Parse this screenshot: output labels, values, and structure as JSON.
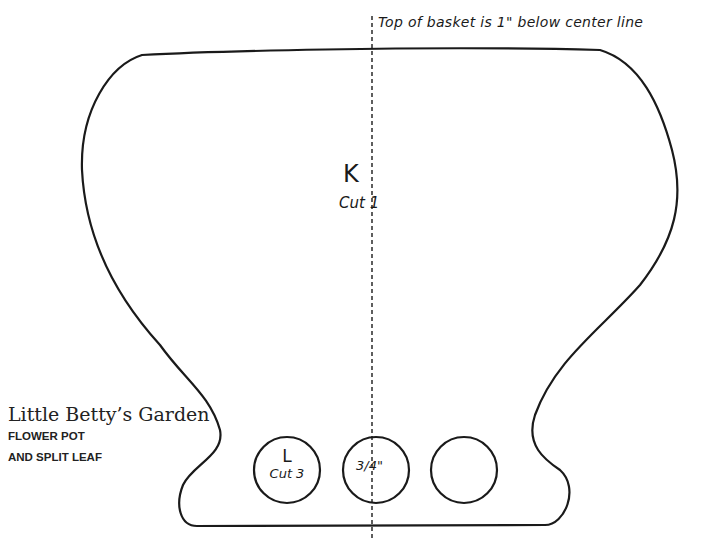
{
  "note": {
    "text": "Top of basket is 1\" below center line"
  },
  "branding": {
    "title": "Little Betty’s Garden",
    "subtitle_line1": "FLOWER POT",
    "subtitle_line2": "AND SPLIT LEAF"
  },
  "pieces": {
    "pot": {
      "letter": "K",
      "cut": "Cut 1"
    },
    "circle": {
      "letter": "L",
      "cut": "Cut 3",
      "size": "3/4\""
    }
  },
  "colors": {
    "line": "#1a1a1a",
    "background": "#ffffff"
  }
}
